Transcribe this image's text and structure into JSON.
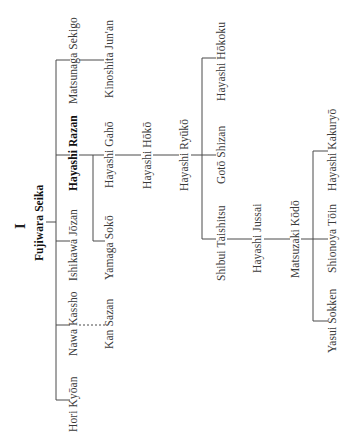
{
  "diagram": {
    "plate_number": "I",
    "root": "Fujiwara Seika",
    "nodes": {
      "fujiwara_seika": "Fujiwara Seika",
      "matsunaga_sekigo": "Matsunaga Sekigo",
      "kinoshita_junan": "Kinoshita Jun'an",
      "hayashi_razan": "Hayashi Razan",
      "hayashi_gaho": "Hayashi Gahō",
      "hayashi_hoko": "Hayashi Hōkō",
      "hayashi_ryuko": "Hayashi Ryūkō",
      "hayashi_hokoku": "Hayashi Hōkoku",
      "goto_shizan": "Gotō Shizan",
      "shibui_taishitsu": "Shibui Taishitsu",
      "hayashi_jussai": "Hayashi Jussai",
      "matsuzaki_kodo": "Matsuzaki Kōdō",
      "hayashi_kakuryo": "Hayashi Kakuryō",
      "shionoya_toin": "Shionoya Tōin",
      "yasui_sokken": "Yasui Sokken",
      "yamaga_soko": "Yamaga Sokō",
      "ishikawa_jozan": "Ishikawa Jōzan",
      "nawa_kassho": "Nawa Kassho",
      "kan_sazan": "Kan Sazan",
      "hori_kyoan": "Hori Kyōan"
    },
    "edges": [
      {
        "from": "Fujiwara Seika",
        "to": "Matsunaga Sekigo",
        "style": "solid"
      },
      {
        "from": "Fujiwara Seika",
        "to": "Hayashi Razan",
        "style": "solid"
      },
      {
        "from": "Fujiwara Seika",
        "to": "Ishikawa Jōzan",
        "style": "solid"
      },
      {
        "from": "Fujiwara Seika",
        "to": "Nawa Kassho",
        "style": "solid"
      },
      {
        "from": "Fujiwara Seika",
        "to": "Hori Kyōan",
        "style": "solid"
      },
      {
        "from": "Matsunaga Sekigo",
        "to": "Kinoshita Jun'an",
        "style": "solid"
      },
      {
        "from": "Hayashi Razan",
        "to": "Hayashi Gahō",
        "style": "solid"
      },
      {
        "from": "Hayashi Razan",
        "to": "Yamaga Sokō",
        "style": "solid"
      },
      {
        "from": "Hayashi Gahō",
        "to": "Hayashi Hōkō",
        "style": "solid"
      },
      {
        "from": "Hayashi Hōkō",
        "to": "Hayashi Ryūkō",
        "style": "solid"
      },
      {
        "from": "Hayashi Ryūkō",
        "to": "Hayashi Hōkoku",
        "style": "solid"
      },
      {
        "from": "Hayashi Ryūkō",
        "to": "Gotō Shizan",
        "style": "solid"
      },
      {
        "from": "Hayashi Ryūkō",
        "to": "Shibui Taishitsu",
        "style": "solid"
      },
      {
        "from": "Shibui Taishitsu",
        "to": "Hayashi Jussai",
        "style": "solid"
      },
      {
        "from": "Hayashi Jussai",
        "to": "Matsuzaki Kōdō",
        "style": "solid"
      },
      {
        "from": "Matsuzaki Kōdō",
        "to": "Hayashi Kakuryō",
        "style": "solid"
      },
      {
        "from": "Matsuzaki Kōdō",
        "to": "Shionoya Tōin",
        "style": "solid"
      },
      {
        "from": "Matsuzaki Kōdō",
        "to": "Yasui Sokken",
        "style": "solid"
      },
      {
        "from": "Nawa Kassho",
        "to": "Kan Sazan",
        "style": "dashed"
      }
    ],
    "colors": {
      "line": "#4a4a4a",
      "text": "#3a3a3a",
      "background": "#ffffff"
    }
  }
}
